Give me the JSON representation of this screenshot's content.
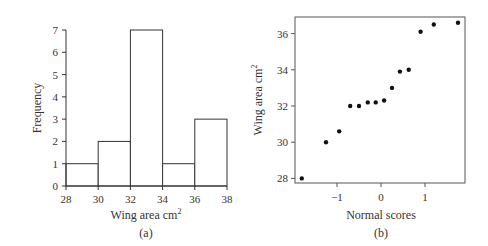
{
  "chart_data": [
    {
      "type": "bar",
      "subtype": "histogram",
      "panel_label": "(a)",
      "title": "",
      "xlabel": "Wing area cm",
      "xlabel_superscript": "2",
      "ylabel": "Frequency",
      "bins": [
        [
          28,
          30
        ],
        [
          30,
          32
        ],
        [
          32,
          34
        ],
        [
          34,
          36
        ],
        [
          36,
          38
        ]
      ],
      "categories": [
        "28-30",
        "30-32",
        "32-34",
        "34-36",
        "36-38"
      ],
      "values": [
        1,
        2,
        7,
        1,
        3
      ],
      "xlim": [
        28,
        38
      ],
      "ylim": [
        0,
        7
      ],
      "xticks": [
        "28",
        "30",
        "32",
        "34",
        "36",
        "38"
      ],
      "yticks": [
        "0",
        "1",
        "2",
        "3",
        "4",
        "5",
        "6",
        "7"
      ],
      "grid": false
    },
    {
      "type": "scatter",
      "subtype": "normal probability plot",
      "panel_label": "(b)",
      "title": "",
      "xlabel": "Normal scores",
      "ylabel": "Wing area cm",
      "ylabel_superscript": "2",
      "x": [
        -1.8,
        -1.25,
        -0.95,
        -0.7,
        -0.5,
        -0.3,
        -0.12,
        0.07,
        0.25,
        0.43,
        0.63,
        0.9,
        1.2,
        1.75
      ],
      "y": [
        28.0,
        30.0,
        30.6,
        32.0,
        32.0,
        32.2,
        32.2,
        32.3,
        33.0,
        33.9,
        34.0,
        36.1,
        36.5,
        36.6
      ],
      "xticks": [
        "-1",
        "0",
        "1"
      ],
      "yticks": [
        "28",
        "30",
        "32",
        "34",
        "36"
      ],
      "xlim": [
        -1.95,
        1.92
      ],
      "ylim": [
        27.8,
        36.95
      ],
      "grid": false
    }
  ],
  "panels": {
    "a": {
      "label": "(a)",
      "xlabel": "Wing area cm",
      "sup": "2",
      "ylabel": "Frequency"
    },
    "b": {
      "label": "(b)",
      "xlabel": "Normal scores",
      "ylabel": "Wing area cm",
      "sup": "2"
    }
  }
}
